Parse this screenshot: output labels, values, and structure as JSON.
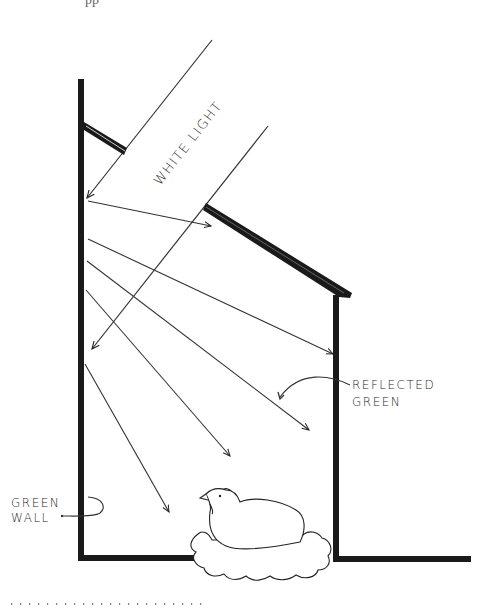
{
  "diagram": {
    "top_text_fragment": "pp",
    "labels": {
      "white_light": "WHITE LIGHT",
      "reflected_line1": "REFLECTED",
      "reflected_line2": "GREEN",
      "green_wall_line1": "GREEN",
      "green_wall_line2": "WALL"
    },
    "elements": [
      "left-wall",
      "roof",
      "right-wall",
      "floor",
      "hen-on-nest",
      "light-rays",
      "reflected-rays",
      "dotted-rule"
    ],
    "colors": {
      "ink": "#1a1a1a",
      "background": "#ffffff"
    }
  }
}
